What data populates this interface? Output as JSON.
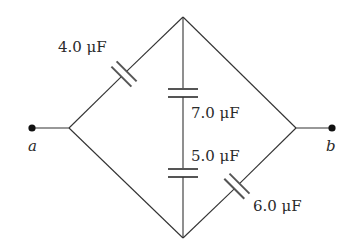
{
  "diagram": {
    "type": "capacitor-network",
    "terminals": [
      {
        "id": "a",
        "label": "a"
      },
      {
        "id": "b",
        "label": "b"
      }
    ],
    "capacitors": [
      {
        "id": "c1",
        "label": "4.0 μF",
        "value_uF": 4.0,
        "branch": "a-to-top"
      },
      {
        "id": "c2",
        "label": "7.0 μF",
        "value_uF": 7.0,
        "branch": "vertical-upper"
      },
      {
        "id": "c3",
        "label": "5.0 μF",
        "value_uF": 5.0,
        "branch": "vertical-lower"
      },
      {
        "id": "c4",
        "label": "6.0 μF",
        "value_uF": 6.0,
        "branch": "bottom-to-b"
      }
    ],
    "colors": {
      "wire": "#333333",
      "plate": "#555555",
      "text": "#2a2a2a",
      "background": "#ffffff"
    }
  }
}
